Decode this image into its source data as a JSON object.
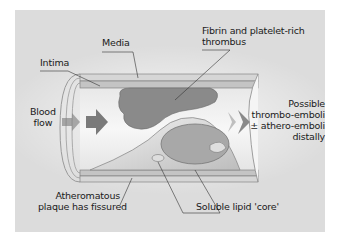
{
  "diagram": {
    "labels": {
      "media": "Media",
      "intima": "Intima",
      "thrombus_line1": "Fibrin and platelet-rich",
      "thrombus_line2": "thrombus",
      "blood_line1": "Blood",
      "blood_line2": "flow",
      "emboli_line1": "Possible",
      "emboli_line2": "thrombo-emboli",
      "emboli_line3": "± athero-emboli",
      "emboli_line4": "distally",
      "plaque_line1": "Atheromatous",
      "plaque_line2": "plaque has fissured",
      "lipid": "Soluble lipid 'core'"
    },
    "colors": {
      "background": "#dcdcdc",
      "vessel_wall": "#c8c8c8",
      "lumen": "#efefef",
      "thrombus": "#8a8a8a",
      "plaque": "#b8b8b8",
      "arrow": "#7a7a7a",
      "leader_line": "#333333"
    }
  }
}
